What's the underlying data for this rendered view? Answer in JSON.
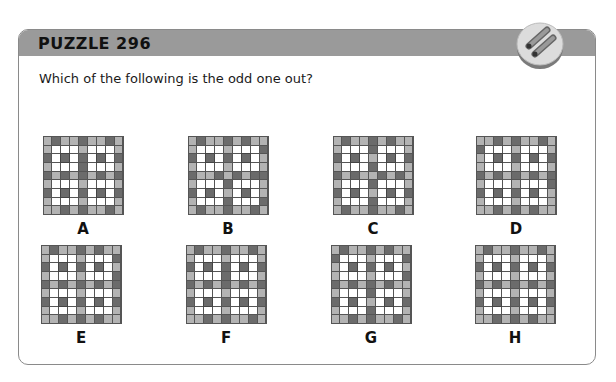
{
  "header": {
    "title": "PUZZLE 296",
    "badge_icon": "two-pencils-icon"
  },
  "question": "Which of the following is the odd one out?",
  "colors": {
    "header_band": "#9a9a9a",
    "light_cell": "#b3b3b3",
    "dark_cell": "#6b6b6b",
    "white_cell": "#ffffff",
    "border": "#8a8a8a"
  },
  "options": [
    {
      "label": "A",
      "x": 41,
      "y": 136,
      "rows": [
        "LDLLDLLDL",
        "LWWWLWWWL",
        "DWCWDWCWD",
        "LWWWDWWWL",
        "DLDLDLDLD",
        "LWWWLWWWL",
        "DWCWDWCWD",
        "LWWWLWWWL",
        "LLDLDLLDL"
      ]
    },
    {
      "label": "B",
      "x": 186,
      "y": 136,
      "rows": [
        "LDLLDLDLL",
        "LWWWLWWWD",
        "DWCWDWCWL",
        "LWWWLWWWL",
        "DLLDLDLDD",
        "LWWWDWWWL",
        "DWCWLWCWL",
        "LWWWDWWWD",
        "LDLLDLLDL"
      ]
    },
    {
      "label": "C",
      "x": 331,
      "y": 136,
      "rows": [
        "LDLLDLDLL",
        "LWWWDWWWL",
        "DWCWLWCWD",
        "LWWWDWWWL",
        "DLDLLDLDL",
        "LWWWDWWWL",
        "DWCWLWCWD",
        "LWWWDWWWL",
        "LDLLDLLDL"
      ]
    },
    {
      "label": "D",
      "x": 474,
      "y": 136,
      "rows": [
        "LLDLDLLDL",
        "DWWWLWWWL",
        "LWCWDWCWD",
        "LWWWLWWWL",
        "DLDLDLDLD",
        "LWWWLWWWD",
        "DWCWDWCWL",
        "LWWWLWWWL",
        "LLDLDLDLL"
      ]
    },
    {
      "label": "E",
      "x": 39,
      "y": 245,
      "rows": [
        "LDLLDLDLL",
        "LWWWLWWWD",
        "DWCWDWCWL",
        "LWWWLWWWD",
        "DLDLDLDLD",
        "LWWWLWWWL",
        "DWCWDWCWD",
        "LWWWLWWWL",
        "LLDLDLDLL"
      ]
    },
    {
      "label": "F",
      "x": 184,
      "y": 245,
      "rows": [
        "LDLLDLLDL",
        "LWWWLWWWL",
        "DWCWDWCWD",
        "LWWWDWWWL",
        "DLDLDLDLD",
        "LWWWLWWWL",
        "DWCWDWCWD",
        "LWWWLWWWL",
        "LLDLDLLDL"
      ]
    },
    {
      "label": "G",
      "x": 329,
      "y": 245,
      "rows": [
        "LDLLDLDLL",
        "DWWWLWWWD",
        "LWCWDWCWL",
        "LWWWLWWWD",
        "DLDLDLDLL",
        "LWWWDWWWL",
        "DWCWLWCWD",
        "LWWWDWWWL",
        "LLDLDLLDL"
      ]
    },
    {
      "label": "H",
      "x": 473,
      "y": 245,
      "rows": [
        "LDLLDLLDL",
        "LWWWLWWWL",
        "DWCWDWCWD",
        "LWWWLWWWL",
        "DLDLDLDLD",
        "LWWWLWWWL",
        "DWCWDWCWD",
        "LWWWLWWWL",
        "LLDLDLDLL"
      ]
    }
  ]
}
